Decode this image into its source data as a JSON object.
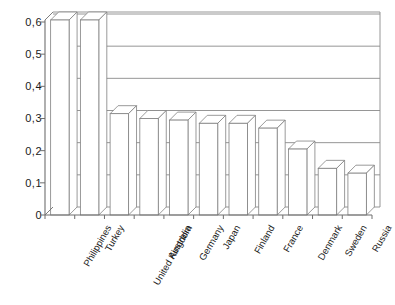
{
  "chart_data": {
    "type": "bar",
    "title": "",
    "subtitle": "",
    "xlabel": "",
    "ylabel": "",
    "categories": [
      "Philippines",
      "Turkey",
      "United Kingdom",
      "Australia",
      "Germany",
      "Japan",
      "Finland",
      "France",
      "Denmark",
      "Sweden",
      "Russia"
    ],
    "values": [
      0.625,
      0.625,
      0.315,
      0.3,
      0.295,
      0.285,
      0.285,
      0.27,
      0.205,
      0.145,
      0.13
    ],
    "series": [
      {
        "name": "",
        "values": [
          0.625,
          0.625,
          0.315,
          0.3,
          0.295,
          0.285,
          0.285,
          0.27,
          0.205,
          0.145,
          0.13
        ]
      }
    ],
    "ylim": [
      0,
      0.63
    ],
    "ytick_values": [
      0,
      0.1,
      0.2,
      0.3,
      0.4,
      0.5,
      0.6
    ],
    "ytick_labels": [
      "0",
      "0,1",
      "0,2",
      "0,3",
      "0,4",
      "0,5",
      "0,6"
    ],
    "grid": true,
    "grid_axis": "y",
    "legend": false,
    "legend_position": "none",
    "style": "3d-bar",
    "bar_fill_color": "#ffffff",
    "bar_edge_color": "#808080",
    "axis_color": "#6e6e6e",
    "grid_color": "#8a8a8a",
    "background_color": "#ffffff",
    "annotations": []
  },
  "axes": {
    "y_axis_name": "value-axis",
    "x_axis_name": "category-axis"
  }
}
